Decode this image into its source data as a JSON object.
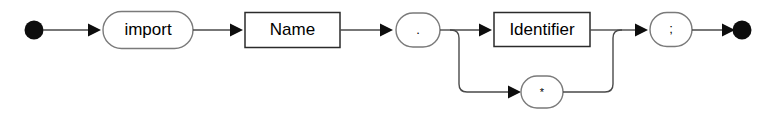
{
  "diagram": {
    "type": "railroad-syntax-diagram",
    "colors": {
      "background": "#ffffff",
      "rail": "#4a4a4a",
      "box_border": "#2b2b2b",
      "round_border": "#7a7a7a",
      "terminal": "#0d0d0d",
      "text": "#000000"
    },
    "start_marker": "start-dot",
    "end_marker": "end-dot",
    "nodes": {
      "keyword_import": {
        "label": "import",
        "shape": "rounded",
        "kind": "terminal"
      },
      "name": {
        "label": "Name",
        "shape": "rectangle",
        "kind": "nonterminal"
      },
      "dot": {
        "label": ".",
        "shape": "rounded",
        "kind": "terminal"
      },
      "identifier": {
        "label": "Identifier",
        "shape": "rectangle",
        "kind": "nonterminal"
      },
      "star": {
        "label": "*",
        "shape": "rounded",
        "kind": "terminal"
      },
      "semicolon": {
        "label": ";",
        "shape": "rounded",
        "kind": "terminal"
      }
    },
    "sequence": [
      "import",
      "Name",
      ".",
      "<choice>",
      ";"
    ],
    "choice_branches": [
      {
        "branch": "upper",
        "label": "Identifier"
      },
      {
        "branch": "lower",
        "label": "*"
      }
    ],
    "production": "import Name . ( Identifier | * ) ;"
  }
}
